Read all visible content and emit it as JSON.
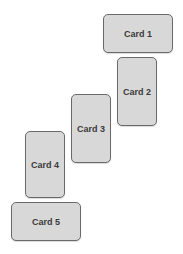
{
  "cards": [
    {
      "label": "Card 1"
    },
    {
      "label": "Card 2"
    },
    {
      "label": "Card 3"
    },
    {
      "label": "Card 4"
    },
    {
      "label": "Card 5"
    }
  ],
  "colors": {
    "background": "#ffffff",
    "card_fill": "#d8d8d8",
    "card_border": "#6a6a6a",
    "card_text": "#3a3a3a"
  }
}
